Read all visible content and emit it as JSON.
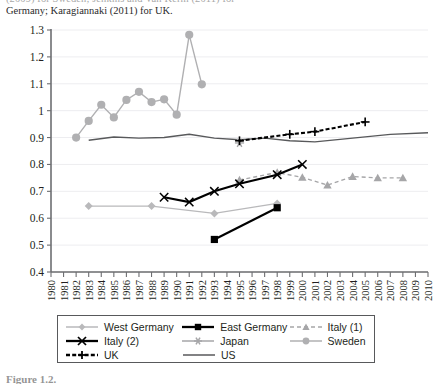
{
  "page": {
    "top_caption_clipped": "Germany; Karagiannaki (2011) for UK.",
    "top_caption_partial_above": "(2009) for Sweden; Jenkins and Van Kerm (2011) for",
    "bottom_caption_clipped": "Figure 1.2."
  },
  "chart_data": {
    "type": "line",
    "title": "",
    "xlabel": "",
    "ylabel": "",
    "xlim": [
      1980,
      2010
    ],
    "ylim": [
      0.4,
      1.3
    ],
    "ytick_step": 0.1,
    "grid": true,
    "legend_position": "bottom",
    "x_ticks": [
      1980,
      1981,
      1982,
      1983,
      1984,
      1985,
      1986,
      1987,
      1988,
      1989,
      1990,
      1991,
      1992,
      1993,
      1994,
      1995,
      1996,
      1997,
      1998,
      1999,
      2000,
      2001,
      2002,
      2003,
      2004,
      2005,
      2006,
      2007,
      2008,
      2009,
      2010
    ],
    "y_ticks": [
      "1.3",
      "1.2",
      "1.1",
      "1",
      "0.9",
      "0.8",
      "0.7",
      "0.6",
      "0.5",
      "0.4"
    ],
    "series": [
      {
        "name": "West Germany",
        "color": "#b9b9bb",
        "marker": "diamond",
        "dash": "solid",
        "points": [
          {
            "x": 1983,
            "y": 0.645
          },
          {
            "x": 1988,
            "y": 0.645
          },
          {
            "x": 1993,
            "y": 0.618
          },
          {
            "x": 1998,
            "y": 0.655
          }
        ]
      },
      {
        "name": "East Germany",
        "color": "#000000",
        "marker": "square",
        "dash": "solid",
        "points": [
          {
            "x": 1993,
            "y": 0.521
          },
          {
            "x": 1998,
            "y": 0.639
          }
        ]
      },
      {
        "name": "Italy (1)",
        "color": "#a6a6a8",
        "marker": "triangle",
        "dash": "dashed",
        "points": [
          {
            "x": 1995,
            "y": 0.742
          },
          {
            "x": 1998,
            "y": 0.77
          },
          {
            "x": 2000,
            "y": 0.752
          },
          {
            "x": 2002,
            "y": 0.723
          },
          {
            "x": 2004,
            "y": 0.755
          },
          {
            "x": 2006,
            "y": 0.75
          },
          {
            "x": 2008,
            "y": 0.75
          }
        ]
      },
      {
        "name": "Italy (2)",
        "color": "#000000",
        "marker": "x",
        "dash": "solid",
        "points": [
          {
            "x": 1989,
            "y": 0.678
          },
          {
            "x": 1991,
            "y": 0.66
          },
          {
            "x": 1993,
            "y": 0.7
          },
          {
            "x": 1995,
            "y": 0.728
          },
          {
            "x": 1998,
            "y": 0.762
          },
          {
            "x": 2000,
            "y": 0.8
          }
        ]
      },
      {
        "name": "Japan",
        "color": "#a6a6a8",
        "marker": "asterisk",
        "dash": "solid",
        "points": [
          {
            "x": 1995,
            "y": 0.88
          }
        ]
      },
      {
        "name": "Sweden",
        "color": "#b0b0b2",
        "marker": "circle",
        "dash": "solid",
        "points": [
          {
            "x": 1982,
            "y": 0.9
          },
          {
            "x": 1983,
            "y": 0.962
          },
          {
            "x": 1984,
            "y": 1.022
          },
          {
            "x": 1985,
            "y": 0.975
          },
          {
            "x": 1986,
            "y": 1.04
          },
          {
            "x": 1987,
            "y": 1.07
          },
          {
            "x": 1988,
            "y": 1.032
          },
          {
            "x": 1989,
            "y": 1.042
          },
          {
            "x": 1990,
            "y": 0.985
          },
          {
            "x": 1991,
            "y": 1.282
          },
          {
            "x": 1992,
            "y": 1.098
          }
        ]
      },
      {
        "name": "UK",
        "color": "#000000",
        "marker": "plus",
        "dash": "dotted-dashed",
        "points": [
          {
            "x": 1995,
            "y": 0.888
          },
          {
            "x": 1999,
            "y": 0.912
          },
          {
            "x": 2001,
            "y": 0.922
          },
          {
            "x": 2005,
            "y": 0.958
          }
        ]
      },
      {
        "name": "US",
        "color": "#58595b",
        "marker": "none",
        "dash": "solid",
        "points": [
          {
            "x": 1983,
            "y": 0.89
          },
          {
            "x": 1985,
            "y": 0.902
          },
          {
            "x": 1987,
            "y": 0.898
          },
          {
            "x": 1989,
            "y": 0.9
          },
          {
            "x": 1991,
            "y": 0.912
          },
          {
            "x": 1993,
            "y": 0.898
          },
          {
            "x": 1995,
            "y": 0.892
          },
          {
            "x": 1997,
            "y": 0.898
          },
          {
            "x": 1999,
            "y": 0.888
          },
          {
            "x": 2001,
            "y": 0.884
          },
          {
            "x": 2004,
            "y": 0.898
          },
          {
            "x": 2007,
            "y": 0.912
          },
          {
            "x": 2010,
            "y": 0.918
          }
        ]
      }
    ]
  },
  "legend": {
    "rows": [
      [
        {
          "label": "West Germany",
          "key": "west-germany"
        },
        {
          "label": "East Germany",
          "key": "east-germany"
        },
        {
          "label": "Italy (1)",
          "key": "italy-1"
        }
      ],
      [
        {
          "label": "Italy (2)",
          "key": "italy-2"
        },
        {
          "label": "Japan",
          "key": "japan"
        },
        {
          "label": "Sweden",
          "key": "sweden"
        }
      ],
      [
        {
          "label": "UK",
          "key": "uk"
        },
        {
          "label": "US",
          "key": "us"
        }
      ]
    ]
  }
}
